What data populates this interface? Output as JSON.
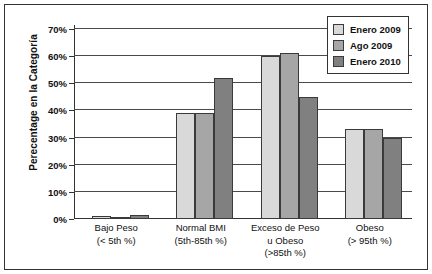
{
  "chart_data": {
    "type": "bar",
    "title": "",
    "xlabel": "",
    "ylabel": "Perecentage en la Categoría",
    "ylim": [
      0,
      70
    ],
    "ytick_values": [
      0,
      10,
      20,
      30,
      40,
      50,
      60,
      70
    ],
    "ytick_labels": [
      "0%",
      "10%",
      "20%",
      "30%",
      "40%",
      "50%",
      "60%",
      "70%"
    ],
    "grid": true,
    "legend_position": "top-right",
    "categories": [
      "Bajo Peso (< 5th %)",
      "Normal BMI (5th-85th %)",
      "Exceso de Peso u Obeso (>85th %)",
      "Obeso (> 95th %)"
    ],
    "category_lines": [
      [
        "Bajo Peso",
        "(< 5th %)"
      ],
      [
        "Normal BMI",
        "(5th-85th %)"
      ],
      [
        "Exceso de Peso",
        "u Obeso",
        "(>85th %)"
      ],
      [
        "Obeso",
        "(> 95th %)"
      ]
    ],
    "series": [
      {
        "name": "Enero 2009",
        "color": "#d9d9d9",
        "values": [
          1,
          39,
          60,
          33
        ]
      },
      {
        "name": "Ago 2009",
        "color": "#a6a6a6",
        "values": [
          0.5,
          39,
          61,
          33
        ]
      },
      {
        "name": "Enero 2010",
        "color": "#808080",
        "values": [
          1.5,
          52,
          45,
          30
        ]
      }
    ]
  },
  "legend": {
    "items": [
      {
        "label": "Enero 2009",
        "color": "#d9d9d9"
      },
      {
        "label": "Ago 2009",
        "color": "#a6a6a6"
      },
      {
        "label": "Enero 2010",
        "color": "#808080"
      }
    ]
  },
  "colors": {
    "axis": "#333333",
    "grid": "#4a4a4a",
    "text": "#111111",
    "background": "#ffffff",
    "series_1": "#d9d9d9",
    "series_2": "#a6a6a6",
    "series_3": "#808080"
  }
}
